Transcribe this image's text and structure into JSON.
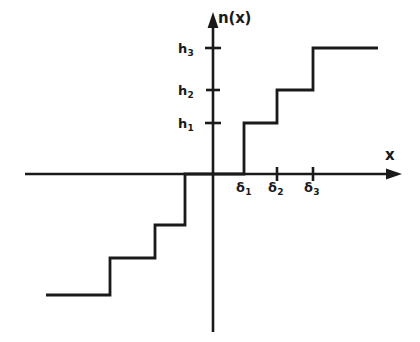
{
  "figure": {
    "kind": "step-function-plot",
    "title": "",
    "background_color": "#ffffff",
    "line_color": "#1a1a1a"
  },
  "axes": {
    "y_axis_label": "n(x)",
    "x_axis_label": "x",
    "origin": {
      "x": 213,
      "y": 174
    },
    "x_axis": {
      "start_x": 25,
      "end_x": 400,
      "y": 174,
      "arrow": "right"
    },
    "y_axis": {
      "x": 213,
      "top_y": 13,
      "bottom_y": 332,
      "arrow": "up"
    }
  },
  "y_ticks": [
    {
      "label": "h",
      "sub": "1",
      "y": 123
    },
    {
      "label": "h",
      "sub": "2",
      "y": 90
    },
    {
      "label": "h",
      "sub": "3",
      "y": 48
    }
  ],
  "x_ticks": [
    {
      "label": "δ",
      "sub": "1",
      "x": 245,
      "has_tick_mark": false
    },
    {
      "label": "δ",
      "sub": "2",
      "x": 277,
      "has_tick_mark": true
    },
    {
      "label": "δ",
      "sub": "3",
      "x": 313,
      "has_tick_mark": true
    }
  ],
  "chart_data": {
    "type": "line",
    "title": "",
    "xlabel": "x",
    "ylabel": "n(x)",
    "grid": false,
    "legend": false,
    "x_breakpoints": [
      "-δ₃",
      "-δ₂",
      "-δ₁",
      "0",
      "δ₁",
      "δ₂",
      "δ₃"
    ],
    "y_levels": [
      "-h₃",
      "-h₂",
      "-h₁",
      "0",
      "h₁",
      "h₂",
      "h₃"
    ],
    "series": [
      {
        "name": "n(x)",
        "points_px": [
          [
            46,
            295
          ],
          [
            110,
            295
          ],
          [
            110,
            258
          ],
          [
            155,
            258
          ],
          [
            155,
            225
          ],
          [
            185,
            225
          ],
          [
            185,
            174
          ],
          [
            244,
            174
          ],
          [
            244,
            123
          ],
          [
            277,
            123
          ],
          [
            277,
            90
          ],
          [
            313,
            90
          ],
          [
            313,
            48
          ],
          [
            378,
            48
          ]
        ],
        "steps": [
          {
            "from": "-∞",
            "to": "-δ₃",
            "value": "-h₃"
          },
          {
            "from": "-δ₃",
            "to": "-δ₂",
            "value": "-h₂"
          },
          {
            "from": "-δ₂",
            "to": "-δ₁",
            "value": "-h₁"
          },
          {
            "from": "-δ₁",
            "to": "δ₁",
            "value": "0"
          },
          {
            "from": "δ₁",
            "to": "δ₂",
            "value": "h₁"
          },
          {
            "from": "δ₂",
            "to": "δ₃",
            "value": "h₂"
          },
          {
            "from": "δ₃",
            "to": "+∞",
            "value": "h₃"
          }
        ]
      }
    ]
  }
}
